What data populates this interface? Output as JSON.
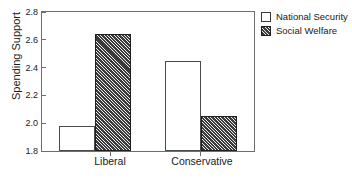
{
  "chart_data": {
    "type": "bar",
    "title": "",
    "xlabel": "",
    "ylabel": "Spending Support",
    "categories": [
      "Liberal",
      "Conservative"
    ],
    "series": [
      {
        "name": "National Security",
        "values": [
          1.98,
          2.45
        ],
        "fill": "solid"
      },
      {
        "name": "Social Welfare",
        "values": [
          2.64,
          2.05
        ],
        "fill": "hatch"
      }
    ],
    "ylim": [
      1.8,
      2.8
    ],
    "yticks": [
      "2.8",
      "2.6",
      "2.4",
      "2.2",
      "2.0",
      "1.8"
    ],
    "ytick_values": [
      2.8,
      2.6,
      2.4,
      2.2,
      2.0,
      1.8
    ],
    "grid": false,
    "legend_position": "right-top",
    "legend_entries": [
      "National Security",
      "Social Welfare"
    ],
    "colors": {
      "axis": "#6e6e6e",
      "text": "#1a1a1a",
      "bar_solid": "#ffffff",
      "bar_hatch": "#3a3a3a",
      "background": "#ffffff"
    }
  },
  "axis": {
    "ylabel": "Spending Support",
    "ytick_0": "2.8",
    "ytick_1": "2.6",
    "ytick_2": "2.4",
    "ytick_3": "2.2",
    "ytick_4": "2.0",
    "ytick_5": "1.8",
    "xtick_0": "Liberal",
    "xtick_1": "Conservative"
  },
  "legend": {
    "entry_0": "National Security",
    "entry_1": "Social Welfare"
  }
}
